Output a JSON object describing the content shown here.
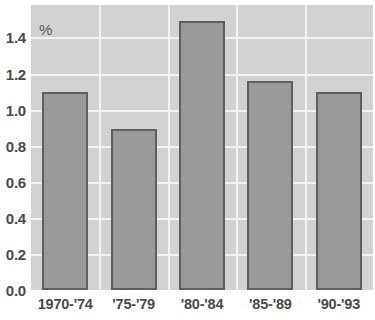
{
  "chart_data": {
    "type": "bar",
    "title": "",
    "subtitle": "",
    "xlabel": "",
    "ylabel": "",
    "unit_label": "%",
    "categories": [
      "1970-'74",
      "'75-'79",
      "'80-'84",
      "'85-'89",
      "'90-'93"
    ],
    "values": [
      1.1,
      0.89,
      1.49,
      1.16,
      1.1
    ],
    "ylim": [
      0.0,
      1.58
    ],
    "yticks": [
      "0.0",
      "0.2",
      "0.4",
      "0.6",
      "0.8",
      "1.0",
      "1.2",
      "1.4"
    ],
    "ytick_values": [
      0.0,
      0.2,
      0.4,
      0.6,
      0.8,
      1.0,
      1.2,
      1.4
    ],
    "grid": true,
    "grid_orientation": "both",
    "legend": null,
    "legend_position": "none",
    "annotations": [],
    "colors": {
      "plot_background": "#d2d2d2",
      "page_background": "#ffffff",
      "gridline": "#f2f2f2",
      "bar_fill": "#9a9a9a",
      "bar_border": "#5e5e5e",
      "tick_label": "#4a4a4a",
      "unit_label": "#5a5a5a"
    }
  }
}
